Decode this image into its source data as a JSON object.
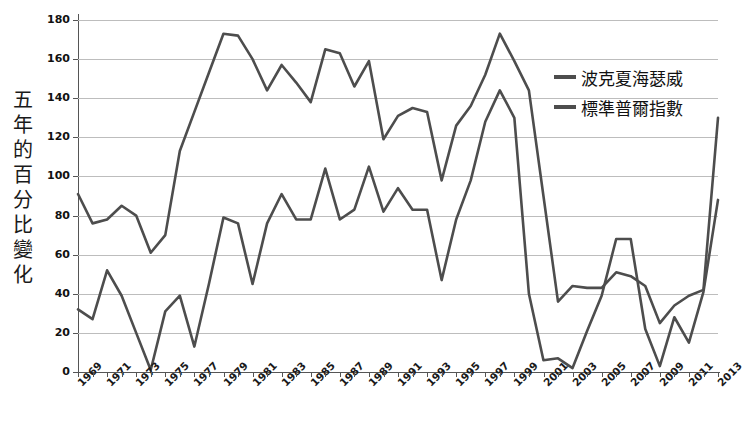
{
  "chart_data": {
    "type": "line",
    "title": "",
    "xlabel": "",
    "ylabel": "五年的百分比變化",
    "ylim": [
      0,
      180
    ],
    "ytick_step": 20,
    "yticks": [
      0,
      20,
      40,
      60,
      80,
      100,
      120,
      140,
      160,
      180
    ],
    "xlim": [
      1969,
      2013
    ],
    "grid": true,
    "legend_position": "upper-right-inside",
    "x": [
      1969,
      1970,
      1971,
      1972,
      1973,
      1974,
      1975,
      1976,
      1977,
      1978,
      1979,
      1980,
      1981,
      1982,
      1983,
      1984,
      1985,
      1986,
      1987,
      1988,
      1989,
      1990,
      1991,
      1992,
      1993,
      1994,
      1995,
      1996,
      1997,
      1998,
      1999,
      2000,
      2001,
      2002,
      2003,
      2004,
      2005,
      2006,
      2007,
      2008,
      2009,
      2010,
      2011,
      2012,
      2013
    ],
    "series": [
      {
        "name": "波克夏海瑟威",
        "color": "#4d4d4d",
        "values": [
          91,
          76,
          78,
          85,
          80,
          61,
          70,
          113,
          133,
          153,
          173,
          172,
          160,
          144,
          157,
          148,
          138,
          165,
          163,
          146,
          159,
          119,
          131,
          135,
          133,
          98,
          126,
          136,
          152,
          173,
          159,
          144,
          90,
          36,
          44,
          43,
          43,
          51,
          49,
          44,
          25,
          34,
          39,
          42,
          130
        ]
      },
      {
        "name": "標準普爾指數",
        "color": "#4d4d4d",
        "values": [
          32,
          27,
          52,
          39,
          20,
          1,
          31,
          39,
          13,
          45,
          79,
          76,
          45,
          76,
          91,
          78,
          78,
          104,
          78,
          83,
          105,
          82,
          94,
          83,
          83,
          47,
          78,
          98,
          128,
          144,
          130,
          40,
          6,
          7,
          2,
          21,
          39,
          68,
          68,
          22,
          3,
          28,
          15,
          41,
          88
        ]
      }
    ]
  },
  "legend": {
    "items": [
      {
        "label": "波克夏海瑟威"
      },
      {
        "label": "標準普爾指數"
      }
    ]
  },
  "axes": {
    "y": {
      "title": "五年的百分比變化",
      "title_chars": [
        "五",
        "年",
        "的",
        "百",
        "分",
        "比",
        "變",
        "化"
      ],
      "ticks": [
        "180",
        "160",
        "140",
        "120",
        "100",
        "80",
        "60",
        "40",
        "20",
        "0"
      ]
    },
    "x": {
      "ticks": [
        "1969",
        "1971",
        "1973",
        "1975",
        "1977",
        "1979",
        "1981",
        "1983",
        "1985",
        "1987",
        "1989",
        "1991",
        "1993",
        "1995",
        "1997",
        "1999",
        "2001",
        "2003",
        "2005",
        "2007",
        "2009",
        "2011",
        "2013"
      ]
    }
  }
}
